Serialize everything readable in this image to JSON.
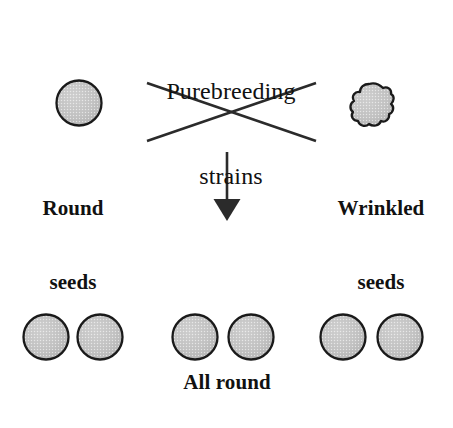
{
  "figure": {
    "type": "genetics-cross-diagram",
    "background_color": "#ffffff",
    "title": {
      "line1": "Purebreeding",
      "line2": "strains"
    },
    "parents": [
      {
        "id": "round-parent",
        "label_line1": "Round",
        "label_line2": "seeds",
        "phenotype": "round",
        "seed_shape": "circle",
        "fill_color": "#c4c4c4",
        "outline_color": "#1a1a1a"
      },
      {
        "id": "wrinkled-parent",
        "label_line1": "Wrinkled",
        "label_line2": "seeds",
        "phenotype": "wrinkled",
        "seed_shape": "irregular-blob",
        "fill_color": "#c4c4c4",
        "outline_color": "#1a1a1a"
      }
    ],
    "cross_symbol": {
      "name": "cross-x-lines",
      "stroke_color": "#2b2b2b"
    },
    "arrow": {
      "name": "down-arrow",
      "direction": "down",
      "stroke_color": "#2b2b2b"
    },
    "offspring": {
      "label": "All round",
      "count": 6,
      "phenotype": "round",
      "groups": 3,
      "seeds_per_group": 2,
      "fill_color": "#c4c4c4",
      "outline_color": "#1a1a1a"
    }
  }
}
